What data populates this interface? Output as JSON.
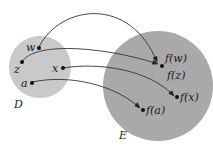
{
  "diagram": {
    "domain_set": {
      "label": "D",
      "color": "#c9c9c9"
    },
    "codomain_set": {
      "label": "E",
      "color": "#a9a9a9"
    },
    "domain_points": [
      {
        "id": "w",
        "label": "w"
      },
      {
        "id": "z",
        "label": "z"
      },
      {
        "id": "x",
        "label": "x"
      },
      {
        "id": "a",
        "label": "a"
      }
    ],
    "image_points": [
      {
        "id": "fw",
        "label": "f(w)"
      },
      {
        "id": "fz",
        "label": "f(z)"
      },
      {
        "id": "fx",
        "label": "f(x)"
      },
      {
        "id": "fa",
        "label": "f(a)"
      }
    ],
    "mappings": [
      {
        "from": "w",
        "to": "f(w)"
      },
      {
        "from": "z",
        "to": "f(z)"
      },
      {
        "from": "x",
        "to": "f(x)"
      },
      {
        "from": "a",
        "to": "f(a)"
      }
    ],
    "line_color": "#333333"
  }
}
